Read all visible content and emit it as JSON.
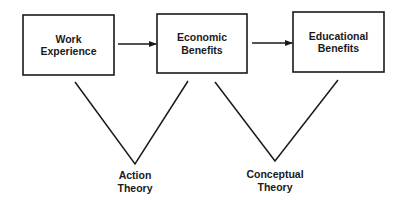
{
  "diagram": {
    "colors": {
      "stroke": "#1a1a1a",
      "background": "#ffffff"
    },
    "boxes": [
      {
        "id": "work-experience",
        "line1": "Work",
        "line2": "Experience"
      },
      {
        "id": "economic-benefits",
        "line1": "Economic",
        "line2": "Benefits"
      },
      {
        "id": "educational-benefits",
        "line1": "Educational",
        "line2": "Benefits"
      }
    ],
    "arrows": [
      {
        "from": "work-experience",
        "to": "economic-benefits"
      },
      {
        "from": "economic-benefits",
        "to": "educational-benefits"
      }
    ],
    "theories": [
      {
        "id": "action-theory",
        "line1": "Action",
        "line2": "Theory",
        "spans": [
          "work-experience",
          "economic-benefits"
        ]
      },
      {
        "id": "conceptual-theory",
        "line1": "Conceptual",
        "line2": "Theory",
        "spans": [
          "economic-benefits",
          "educational-benefits"
        ]
      }
    ]
  }
}
